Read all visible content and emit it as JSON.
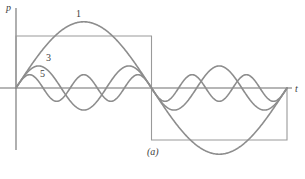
{
  "figure": {
    "caption": "(a)",
    "axes": {
      "y_label": "p",
      "x_label": "t"
    },
    "harmonic_labels": [
      {
        "name": "fundamental",
        "text": "1"
      },
      {
        "name": "third-harmonic",
        "text": "3"
      },
      {
        "name": "fifth-harmonic",
        "text": "5"
      }
    ]
  },
  "colors": {
    "curve": "#8d8d8d",
    "square": "#9a9a9a",
    "axis": "#6e6e6e",
    "text": "#3d3d3d",
    "background": "#ffffff"
  },
  "chart_data": {
    "type": "line",
    "title": "",
    "subtitle": "(a)",
    "xlabel": "t",
    "ylabel": "p",
    "grid": false,
    "legend": "inline-annotations",
    "annotations": [
      {
        "label": "1",
        "x": 84,
        "y": 24,
        "meaning": "fundamental (1st harmonic)"
      },
      {
        "label": "3",
        "x": 48,
        "y": 59,
        "meaning": "3rd harmonic"
      },
      {
        "label": "5",
        "x": 43,
        "y": 75,
        "meaning": "5th harmonic"
      },
      {
        "label": "(a)",
        "x": 155,
        "y": 152,
        "meaning": "figure caption"
      }
    ],
    "axis_origin_px": {
      "x": 16,
      "y": 88
    },
    "x_axis_span_px": [
      0,
      305
    ],
    "y_axis_span_px": [
      8,
      150
    ],
    "period_px": 271,
    "xlim": [
      0,
      1
    ],
    "ylim": [
      -1.35,
      1.35
    ],
    "series": [
      {
        "name": "square-wave",
        "kind": "square",
        "amplitude": 1.0,
        "period": 1.0,
        "phase": 0.0,
        "values_description": "+1 for 0<t<0.5, -1 for 0.5<t<1",
        "points": [
          [
            0.0,
            0.0
          ],
          [
            0.0,
            1.0
          ],
          [
            0.5,
            1.0
          ],
          [
            0.5,
            -1.0
          ],
          [
            1.0,
            -1.0
          ],
          [
            1.0,
            0.0
          ]
        ]
      },
      {
        "name": "harmonic-1",
        "kind": "sine",
        "harmonic": 1,
        "amplitude": 1.273,
        "period": 1.0,
        "phase": 0.0
      },
      {
        "name": "harmonic-3",
        "kind": "sine",
        "harmonic": 3,
        "amplitude": 0.424,
        "period": 0.3333,
        "phase": 0.0
      },
      {
        "name": "harmonic-5",
        "kind": "sine",
        "harmonic": 5,
        "amplitude": 0.255,
        "period": 0.2,
        "phase": 0.0
      }
    ]
  }
}
